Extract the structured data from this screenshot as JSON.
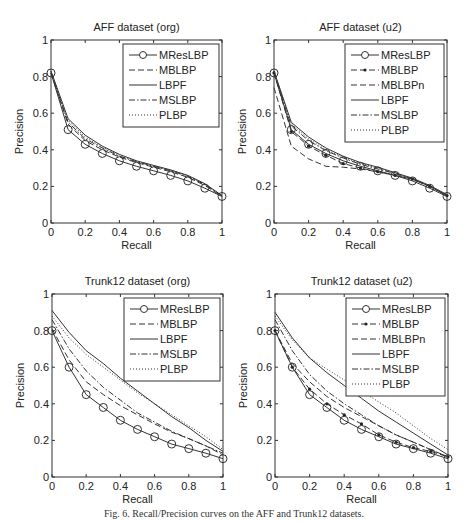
{
  "caption": "Fig. 6. Recall/Precision curves on the AFF and Trunk12 datasets.",
  "chart_data": [
    {
      "type": "line",
      "title": "AFF dataset (org)",
      "xlabel": "Recall",
      "ylabel": "Precision",
      "xlim": [
        0,
        1
      ],
      "ylim": [
        0,
        1
      ],
      "xticks": [
        "0",
        "0.2",
        "0.4",
        "0.6",
        "0.8",
        "1"
      ],
      "yticks": [
        "0",
        "0.2",
        "0.4",
        "0.6",
        "0.8",
        "1"
      ],
      "grid": false,
      "legend_position": "upper right",
      "x": [
        0,
        0.1,
        0.2,
        0.3,
        0.4,
        0.5,
        0.6,
        0.7,
        0.8,
        0.9,
        1.0
      ],
      "series": [
        {
          "name": "MResLBP",
          "style": "solid-circle",
          "values": [
            0.82,
            0.51,
            0.43,
            0.38,
            0.34,
            0.31,
            0.285,
            0.26,
            0.23,
            0.19,
            0.145
          ]
        },
        {
          "name": "MBLBP",
          "style": "dashed",
          "values": [
            0.82,
            0.54,
            0.45,
            0.4,
            0.36,
            0.33,
            0.305,
            0.28,
            0.25,
            0.205,
            0.145
          ]
        },
        {
          "name": "LBPF",
          "style": "solid",
          "values": [
            0.83,
            0.57,
            0.48,
            0.42,
            0.375,
            0.34,
            0.315,
            0.29,
            0.26,
            0.215,
            0.15
          ]
        },
        {
          "name": "MSLBP",
          "style": "dashdot",
          "values": [
            0.82,
            0.55,
            0.46,
            0.41,
            0.365,
            0.335,
            0.31,
            0.285,
            0.255,
            0.21,
            0.148
          ]
        },
        {
          "name": "PLBP",
          "style": "dotted",
          "values": [
            0.83,
            0.56,
            0.47,
            0.415,
            0.37,
            0.338,
            0.312,
            0.288,
            0.258,
            0.212,
            0.15
          ]
        }
      ]
    },
    {
      "type": "line",
      "title": "AFF dataset (u2)",
      "xlabel": "Recall",
      "ylabel": "Precision",
      "xlim": [
        0,
        1
      ],
      "ylim": [
        0,
        1
      ],
      "xticks": [
        "0",
        "0.2",
        "0.4",
        "0.6",
        "0.8",
        "1"
      ],
      "yticks": [
        "0",
        "0.2",
        "0.4",
        "0.6",
        "0.8",
        "1"
      ],
      "grid": false,
      "legend_position": "upper right",
      "x": [
        0,
        0.1,
        0.2,
        0.3,
        0.4,
        0.5,
        0.6,
        0.7,
        0.8,
        0.9,
        1.0
      ],
      "series": [
        {
          "name": "MResLBP",
          "style": "solid-circle",
          "values": [
            0.82,
            0.51,
            0.43,
            0.38,
            0.34,
            0.31,
            0.285,
            0.26,
            0.23,
            0.19,
            0.145
          ]
        },
        {
          "name": "MBLBP",
          "style": "dashed-dot-marker",
          "values": [
            0.82,
            0.5,
            0.42,
            0.37,
            0.325,
            0.3,
            0.28,
            0.26,
            0.24,
            0.2,
            0.15
          ]
        },
        {
          "name": "MBLBPn",
          "style": "dashed",
          "values": [
            0.74,
            0.42,
            0.35,
            0.31,
            0.305,
            0.295,
            0.28,
            0.26,
            0.24,
            0.2,
            0.15
          ]
        },
        {
          "name": "LBPF",
          "style": "solid",
          "values": [
            0.83,
            0.55,
            0.47,
            0.41,
            0.365,
            0.33,
            0.305,
            0.275,
            0.245,
            0.205,
            0.155
          ]
        },
        {
          "name": "MSLBP",
          "style": "dashdot",
          "values": [
            0.82,
            0.53,
            0.45,
            0.395,
            0.355,
            0.32,
            0.295,
            0.27,
            0.24,
            0.2,
            0.15
          ]
        },
        {
          "name": "PLBP",
          "style": "dotted",
          "values": [
            0.83,
            0.54,
            0.46,
            0.4,
            0.36,
            0.325,
            0.3,
            0.272,
            0.243,
            0.203,
            0.152
          ]
        }
      ]
    },
    {
      "type": "line",
      "title": "Trunk12 dataset (org)",
      "xlabel": "Recall",
      "ylabel": "Precision",
      "xlim": [
        0,
        1
      ],
      "ylim": [
        0,
        1
      ],
      "xticks": [
        "0",
        "0.2",
        "0.4",
        "0.6",
        "0.8",
        "1"
      ],
      "yticks": [
        "0",
        "0.2",
        "0.4",
        "0.6",
        "0.8",
        "1"
      ],
      "grid": false,
      "legend_position": "upper right",
      "x": [
        0,
        0.1,
        0.2,
        0.3,
        0.4,
        0.5,
        0.6,
        0.7,
        0.8,
        0.9,
        1.0
      ],
      "series": [
        {
          "name": "MResLBP",
          "style": "solid-circle",
          "values": [
            0.8,
            0.6,
            0.45,
            0.38,
            0.31,
            0.26,
            0.22,
            0.18,
            0.155,
            0.13,
            0.1
          ]
        },
        {
          "name": "MBLBP",
          "style": "dashed",
          "values": [
            0.81,
            0.64,
            0.52,
            0.45,
            0.39,
            0.34,
            0.29,
            0.245,
            0.21,
            0.17,
            0.12
          ]
        },
        {
          "name": "LBPF",
          "style": "solid",
          "values": [
            0.91,
            0.79,
            0.69,
            0.62,
            0.54,
            0.47,
            0.4,
            0.33,
            0.27,
            0.2,
            0.14
          ]
        },
        {
          "name": "MSLBP",
          "style": "dashdot",
          "values": [
            0.86,
            0.7,
            0.58,
            0.49,
            0.42,
            0.35,
            0.3,
            0.25,
            0.21,
            0.17,
            0.13
          ]
        },
        {
          "name": "PLBP",
          "style": "dotted",
          "values": [
            0.88,
            0.76,
            0.67,
            0.6,
            0.53,
            0.46,
            0.4,
            0.34,
            0.28,
            0.22,
            0.15
          ]
        }
      ]
    },
    {
      "type": "line",
      "title": "Trunk12 dataset (u2)",
      "xlabel": "Recall",
      "ylabel": "Precision",
      "xlim": [
        0,
        1
      ],
      "ylim": [
        0,
        1
      ],
      "xticks": [
        "0",
        "0.2",
        "0.4",
        "0.6",
        "0.8",
        "1"
      ],
      "yticks": [
        "0",
        "0.2",
        "0.4",
        "0.6",
        "0.8",
        "1"
      ],
      "grid": false,
      "legend_position": "upper right",
      "x": [
        0,
        0.1,
        0.2,
        0.3,
        0.4,
        0.5,
        0.6,
        0.7,
        0.8,
        0.9,
        1.0
      ],
      "series": [
        {
          "name": "MResLBP",
          "style": "solid-circle",
          "values": [
            0.8,
            0.6,
            0.45,
            0.38,
            0.31,
            0.26,
            0.22,
            0.18,
            0.155,
            0.13,
            0.1
          ]
        },
        {
          "name": "MBLBP",
          "style": "dashed-dot-marker",
          "values": [
            0.8,
            0.6,
            0.48,
            0.4,
            0.34,
            0.29,
            0.23,
            0.19,
            0.16,
            0.14,
            0.11
          ]
        },
        {
          "name": "MBLBPn",
          "style": "dashed",
          "values": [
            0.8,
            0.62,
            0.52,
            0.44,
            0.38,
            0.33,
            0.28,
            0.23,
            0.19,
            0.15,
            0.11
          ]
        },
        {
          "name": "LBPF",
          "style": "solid",
          "values": [
            0.9,
            0.76,
            0.65,
            0.57,
            0.5,
            0.43,
            0.36,
            0.3,
            0.24,
            0.18,
            0.12
          ]
        },
        {
          "name": "MSLBP",
          "style": "dashdot",
          "values": [
            0.86,
            0.69,
            0.56,
            0.47,
            0.4,
            0.34,
            0.28,
            0.23,
            0.19,
            0.15,
            0.11
          ]
        },
        {
          "name": "PLBP",
          "style": "dotted",
          "values": [
            0.88,
            0.75,
            0.65,
            0.59,
            0.53,
            0.47,
            0.41,
            0.35,
            0.28,
            0.21,
            0.15
          ]
        }
      ]
    }
  ]
}
